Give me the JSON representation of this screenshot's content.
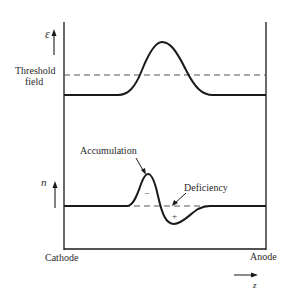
{
  "diagram": {
    "top_panel": {
      "y_axis_symbol": "ε",
      "threshold_label_line1": "Threshold",
      "threshold_label_line2": "field"
    },
    "bottom_panel": {
      "y_axis_symbol": "n",
      "accumulation_label": "Accumulation",
      "deficiency_label": "Deficiency",
      "minus_sign": "−",
      "plus_sign": "+"
    },
    "x_axis": {
      "left_label": "Cathode",
      "right_label": "Anode",
      "direction_symbol": "z"
    },
    "colors": {
      "line": "#1a1a1a",
      "dashed": "#555555",
      "text": "#2a2a2a"
    }
  }
}
